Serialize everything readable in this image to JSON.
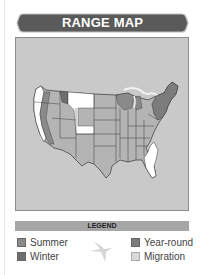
{
  "header": {
    "title": "RANGE MAP"
  },
  "map": {
    "region": "United States",
    "background_color": "#c9c9c9",
    "land_color": "#b4b4b4",
    "summer_color": "#8a8a8a",
    "winter_color": "#6e6e6e",
    "yearround_color": "#7c7c7c",
    "migration_color": "#d8d8d8",
    "white_color": "#ffffff"
  },
  "legend": {
    "title": "LEGEND",
    "items": [
      {
        "label": "Summer",
        "color": "#8a8a8a"
      },
      {
        "label": "Winter",
        "color": "#6e6e6e"
      },
      {
        "label": "Year-round",
        "color": "#7c7c7c"
      },
      {
        "label": "Migration",
        "color": "#d8d8d8"
      }
    ],
    "icon": "bird-silhouette-icon"
  }
}
